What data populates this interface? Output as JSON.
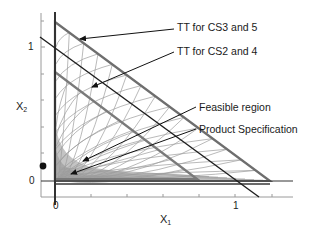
{
  "diagram": {
    "annotations": [
      {
        "id": "tt-cs3-5",
        "text": "TT for CS3 and 5"
      },
      {
        "id": "tt-cs2-4",
        "text": "TT for CS2 and 4"
      },
      {
        "id": "feasible",
        "text": "Feasible region"
      },
      {
        "id": "product-spec",
        "text": "Product Specification"
      }
    ],
    "axes": {
      "x_label": "X",
      "x_sub": "1",
      "y_label": "X",
      "y_sub": "2",
      "x_ticks": [
        "0",
        "1"
      ],
      "y_ticks": [
        "1",
        "0"
      ]
    },
    "colors": {
      "outer_triangle": "#6e6e6e",
      "inner_triangle": "#7a7a7a",
      "curves": "#9a9a9a",
      "feasible_fill": "#b8b8b8",
      "axis": "#333333",
      "frame": "#9a9a9a",
      "diagonal": "#1e1e1e"
    }
  }
}
